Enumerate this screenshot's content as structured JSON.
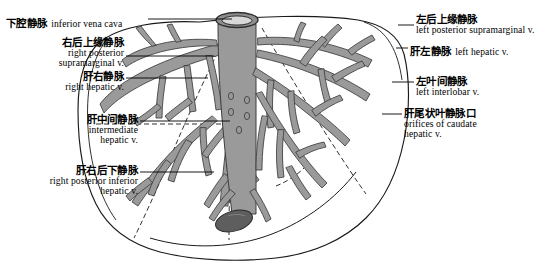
{
  "figure": {
    "title_cn": "肝静脉解剖图",
    "organ": "liver",
    "palette": {
      "vessel_fill": "#9a9a9a",
      "vessel_stroke": "#3c3c3c",
      "outline": "#1a1a1a",
      "background": "#ffffff",
      "gallbladder": "#5e5e5e",
      "ivc_lumen": "#d8d8d8",
      "leader_line": "#000000"
    },
    "ivc_opening_label": "inferior vena cava orifice",
    "gallbladder_label": "caudate lobe body"
  },
  "labels_left": [
    {
      "id": "inferior-vena-cava",
      "cn": "下腔静脉",
      "en": "inferior vena cava",
      "inline": true,
      "x": 6,
      "y": 14,
      "leader_x1": 148,
      "leader_x2": 232,
      "leader_y": 19
    },
    {
      "id": "right-posterior-supramarginal-vein",
      "cn": "右后上缘静脉",
      "en_line1": "right posterior",
      "en_line2": "supramarginal v.",
      "inline": false,
      "x": 12,
      "y": 38,
      "width": 112,
      "leader_x1": 126,
      "leader_x2": 214,
      "leader_y": 56
    },
    {
      "id": "right-hepatic-vein",
      "cn": "肝右静脉",
      "en_line1": "right hepatic v.",
      "inline": false,
      "x": 12,
      "y": 72,
      "width": 112,
      "leader_x1": 126,
      "leader_x2": 208,
      "leader_y": 78
    },
    {
      "id": "intermediate-hepatic-vein",
      "cn": "肝中间静脉",
      "en_line1": "intermediate",
      "en_line2": "hepatic v.",
      "inline": false,
      "x": 34,
      "y": 115,
      "width": 104,
      "leader_x1": 140,
      "leader_x2": 230,
      "leader_y": 121
    },
    {
      "id": "right-posterior-inferior-hepatic-vein",
      "cn": "肝右后下静脉",
      "en_line1": "right posterior inferior",
      "en_line2": "hepatic v.",
      "inline": false,
      "x": 6,
      "y": 166,
      "width": 132,
      "leader_x1": 140,
      "leader_x2": 214,
      "leader_y": 172
    }
  ],
  "labels_right": [
    {
      "id": "left-posterior-supramarginal-vein",
      "cn": "左后上缘静脉",
      "en_line1": "left posterior supramarginal v.",
      "inline": false,
      "x": 416,
      "y": 14,
      "leader_x1": 398,
      "leader_x2": 414,
      "leader_y": 25
    },
    {
      "id": "left-hepatic-vein",
      "cn": "肝左静脉",
      "en": "left hepatic v.",
      "inline": true,
      "x": 410,
      "y": 42,
      "leader_x1": 396,
      "leader_x2": 408,
      "leader_y": 48
    },
    {
      "id": "left-interlobar-vein",
      "cn": "左叶间静脉",
      "en_line1": "left interlobar v.",
      "inline": false,
      "x": 416,
      "y": 76,
      "leader_x1": 392,
      "leader_x2": 414,
      "leader_y": 82
    },
    {
      "id": "orifices-of-caudate-hepatic-vein",
      "cn": "肝尾状叶静脉口",
      "en_line1": "orifices of caudate",
      "en_line2": "hepatic v.",
      "inline": false,
      "x": 404,
      "y": 108,
      "leader_x1": 382,
      "leader_x2": 402,
      "leader_y": 114
    }
  ]
}
